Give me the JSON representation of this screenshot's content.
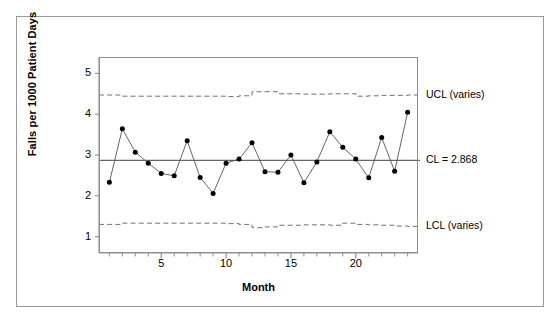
{
  "chart_data": {
    "type": "line",
    "title": "",
    "subtitle": "",
    "xlabel": "Month",
    "ylabel": "Falls per 1000 Patient Days",
    "xlim": [
      0.2,
      24.8
    ],
    "ylim": [
      0.6,
      5.4
    ],
    "grid": false,
    "legend": "none",
    "x": [
      1,
      2,
      3,
      4,
      5,
      6,
      7,
      8,
      9,
      10,
      11,
      12,
      13,
      14,
      15,
      16,
      17,
      18,
      19,
      20,
      21,
      22,
      23,
      24
    ],
    "categories": [
      "1",
      "2",
      "3",
      "4",
      "5",
      "6",
      "7",
      "8",
      "9",
      "10",
      "11",
      "12",
      "13",
      "14",
      "15",
      "16",
      "17",
      "18",
      "19",
      "20",
      "21",
      "22",
      "23",
      "24"
    ],
    "series": [
      {
        "name": "Falls per 1000 Patient Days",
        "marker": "filled-circle",
        "values": [
          2.33,
          3.64,
          3.07,
          2.8,
          2.55,
          2.49,
          3.35,
          2.45,
          2.06,
          2.8,
          2.9,
          3.3,
          2.59,
          2.58,
          3.0,
          2.32,
          2.83,
          3.57,
          3.19,
          2.9,
          2.44,
          3.43,
          2.6,
          4.05
        ]
      },
      {
        "name": "UCL (varies)",
        "style": "dashed",
        "values": [
          4.47,
          4.44,
          4.44,
          4.44,
          4.44,
          4.44,
          4.44,
          4.44,
          4.44,
          4.43,
          4.45,
          4.55,
          4.55,
          4.5,
          4.5,
          4.49,
          4.49,
          4.5,
          4.5,
          4.44,
          4.45,
          4.46,
          4.46,
          4.47
        ]
      },
      {
        "name": "CL = 2.868",
        "style": "solid",
        "values": [
          2.868,
          2.868,
          2.868,
          2.868,
          2.868,
          2.868,
          2.868,
          2.868,
          2.868,
          2.868,
          2.868,
          2.868,
          2.868,
          2.868,
          2.868,
          2.868,
          2.868,
          2.868,
          2.868,
          2.868,
          2.868,
          2.868,
          2.868,
          2.868
        ]
      },
      {
        "name": "LCL (varies)",
        "style": "dashed",
        "values": [
          1.3,
          1.33,
          1.33,
          1.33,
          1.33,
          1.33,
          1.33,
          1.33,
          1.33,
          1.32,
          1.3,
          1.22,
          1.24,
          1.28,
          1.28,
          1.29,
          1.29,
          1.28,
          1.33,
          1.3,
          1.29,
          1.28,
          1.26,
          1.25
        ]
      }
    ],
    "center_line_value": 2.868,
    "yticks": [
      1,
      2,
      3,
      4,
      5
    ],
    "ytick_labels": [
      "1",
      "2",
      "3",
      "4",
      "5"
    ],
    "xticks_major": [
      5,
      10,
      15,
      20
    ],
    "xtick_major_labels": [
      "5",
      "10",
      "15",
      "20"
    ],
    "xticks_minor": [
      1,
      2,
      3,
      4,
      6,
      7,
      8,
      9,
      11,
      12,
      13,
      14,
      16,
      17,
      18,
      19,
      21,
      22,
      23,
      24
    ],
    "annotations": [
      {
        "name": "ucl-label",
        "text": "UCL (varies)",
        "value": 4.47
      },
      {
        "name": "cl-label",
        "text": "CL = 2.868",
        "value": 2.868
      },
      {
        "name": "lcl-label",
        "text": "LCL (varies)",
        "value": 1.25
      }
    ],
    "colors": {
      "series_line": "#555555",
      "marker": "#000000",
      "control_limit": "#707070",
      "center_line": "#666666",
      "axis": "#8f8f8f",
      "frame": "#9a9a9a",
      "background": "#ffffff",
      "text": "#000000"
    }
  }
}
